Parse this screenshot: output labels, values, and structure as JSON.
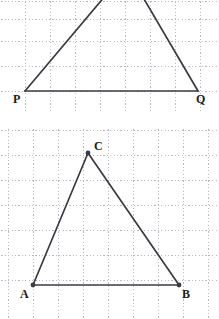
{
  "figure": {
    "background_color": "#ffffff",
    "grid_color": "#b9b9c4",
    "stroke_color": "#3a3a42",
    "label_color": "#1a1a1a",
    "grid_spacing_px": 25
  },
  "panels": [
    {
      "id": "panel-top",
      "name": "triangle-pq-panel",
      "grid": {
        "spacing": 25,
        "x_lines": [
          25,
          50,
          75,
          100,
          125,
          150,
          175,
          200
        ],
        "y_lines": [
          1,
          19,
          41,
          66,
          91
        ],
        "style": "dotted"
      },
      "shape": {
        "type": "triangle",
        "clipped_at_top": true,
        "vertices": [
          {
            "label": "P",
            "x": 25,
            "y": 91,
            "visible": true,
            "marker": false
          },
          {
            "label": "Q",
            "x": 198,
            "y": 91,
            "visible": true,
            "marker": false
          },
          {
            "label": "",
            "x": 127,
            "y": -30,
            "visible": false,
            "marker": false
          }
        ],
        "edges": [
          {
            "name": "base-pq",
            "from": 0,
            "to": 1
          },
          {
            "name": "side-p-apex",
            "from": 0,
            "to": 2
          },
          {
            "name": "side-apex-q",
            "from": 2,
            "to": 1
          }
        ]
      },
      "labels": [
        {
          "text": "P",
          "x": 13,
          "y": 93,
          "name": "vertex-label-p"
        },
        {
          "text": "Q",
          "x": 196,
          "y": 93,
          "name": "vertex-label-q"
        }
      ]
    },
    {
      "id": "panel-bottom",
      "name": "triangle-abc-panel",
      "grid": {
        "spacing": 25,
        "x_lines": [
          8,
          33,
          58,
          83,
          108,
          133,
          158,
          183,
          208
        ],
        "y_lines": [
          2,
          27,
          52,
          77,
          102,
          127,
          152
        ],
        "style": "dotted"
      },
      "shape": {
        "type": "triangle",
        "clipped_at_top": false,
        "vertices": [
          {
            "label": "A",
            "x": 33,
            "y": 157,
            "visible": true,
            "marker": true
          },
          {
            "label": "B",
            "x": 179,
            "y": 157,
            "visible": true,
            "marker": true
          },
          {
            "label": "C",
            "x": 88,
            "y": 25,
            "visible": true,
            "marker": true
          }
        ],
        "edges": [
          {
            "name": "base-ab",
            "from": 0,
            "to": 1
          },
          {
            "name": "side-ac",
            "from": 0,
            "to": 2
          },
          {
            "name": "side-cb",
            "from": 2,
            "to": 1
          }
        ]
      },
      "labels": [
        {
          "text": "A",
          "x": 20,
          "y": 160,
          "name": "vertex-label-a"
        },
        {
          "text": "B",
          "x": 182,
          "y": 160,
          "name": "vertex-label-b"
        },
        {
          "text": "C",
          "x": 94,
          "y": 12,
          "name": "vertex-label-c"
        }
      ]
    }
  ]
}
